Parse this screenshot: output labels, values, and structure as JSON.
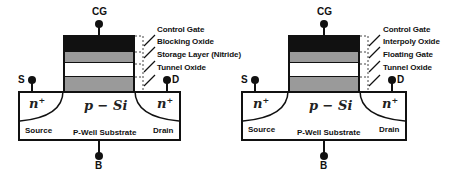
{
  "diagrams": [
    {
      "name": "charge-trap-flash",
      "terminals": {
        "gate": "CG",
        "source": "S",
        "drain": "D",
        "body": "B"
      },
      "layers": [
        "Control Gate",
        "Blocking Oxide",
        "Storage Layer (Nitride)",
        "Tunnel Oxide"
      ],
      "regions": {
        "source_doping": "n",
        "drain_doping": "n",
        "doping_sup": "+",
        "channel": "p − Si",
        "source": "Source",
        "drain": "Drain",
        "substrate": "P-Well Substrate"
      }
    },
    {
      "name": "floating-gate-flash",
      "terminals": {
        "gate": "CG",
        "source": "S",
        "drain": "D",
        "body": "B"
      },
      "layers": [
        "Control Gate",
        "Interpoly Oxide",
        "Floating Gate",
        "Tunnel Oxide"
      ],
      "regions": {
        "source_doping": "n",
        "drain_doping": "n",
        "doping_sup": "+",
        "channel": "p − Si",
        "source": "Source",
        "drain": "Drain",
        "substrate": "P-Well Substrate"
      }
    }
  ],
  "colors": {
    "control_gate": "#111111",
    "gray_layer": "#9a9a9a",
    "white_layer": "#ffffff"
  }
}
